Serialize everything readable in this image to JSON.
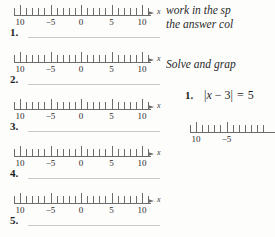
{
  "page": {
    "background": "#fdfdfc",
    "ink": "#2a2a2a",
    "rule_color": "#c9c9c9",
    "axis_color": "#6d6d6d"
  },
  "left_column": {
    "exercises": [
      {
        "number": "1."
      },
      {
        "number": "2."
      },
      {
        "number": "3."
      },
      {
        "number": "4."
      },
      {
        "number": "5."
      }
    ],
    "number_line": {
      "axis_label": "x",
      "tick_labels": [
        "10",
        "−5",
        "0",
        "5",
        "10"
      ],
      "tick_values": [
        -10,
        -5,
        0,
        5,
        10
      ],
      "minor_tick_step": 1,
      "range": [
        -11,
        11
      ],
      "arrow": "right-arrow"
    },
    "answer_blank": ""
  },
  "right_column": {
    "instructions_line1": "work in the sp",
    "instructions_line2": "the answer col",
    "section_heading": "Solve and grap",
    "problem": {
      "number": "1.",
      "expression_parts": {
        "open_bar": "|",
        "variable": "x",
        "operator": "−",
        "constant": "3",
        "close_bar": "|",
        "equals": "=",
        "result": "5"
      },
      "expression_text": "|x − 3| = 5"
    },
    "number_line": {
      "tick_labels": [
        "10",
        "−5"
      ],
      "tick_values": [
        -10,
        -5
      ],
      "minor_tick_step": 1,
      "range": [
        -11,
        1
      ]
    }
  }
}
